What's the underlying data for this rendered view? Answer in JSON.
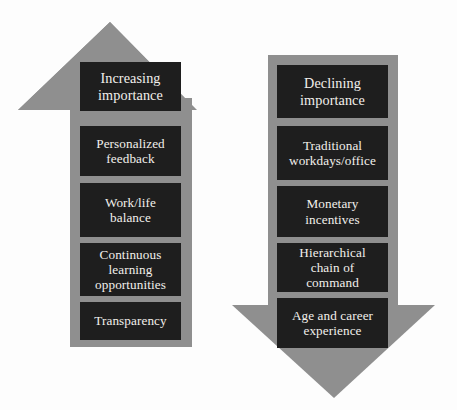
{
  "diagram": {
    "background_color": "#fdfdfd",
    "arrow_color": "#8f8f8f",
    "box_color": "#1e1e1e",
    "box_text_color": "#f2f0ec"
  },
  "arrows": [
    {
      "id": "up-arrow",
      "direction": "up",
      "name": "increasing-importance-arrow",
      "heading": "Increasing\nimportance",
      "items": [
        "Personalized\nfeedback",
        "Work/life\nbalance",
        "Continuous\nlearning\nopportunities",
        "Transparency"
      ]
    },
    {
      "id": "down-arrow",
      "direction": "down",
      "name": "declining-importance-arrow",
      "heading": "Declining\nimportance",
      "items": [
        "Traditional\nworkdays/office",
        "Monetary\nincentives",
        "Hierarchical\nchain of\ncommand",
        "Age and career\nexperience"
      ]
    }
  ]
}
